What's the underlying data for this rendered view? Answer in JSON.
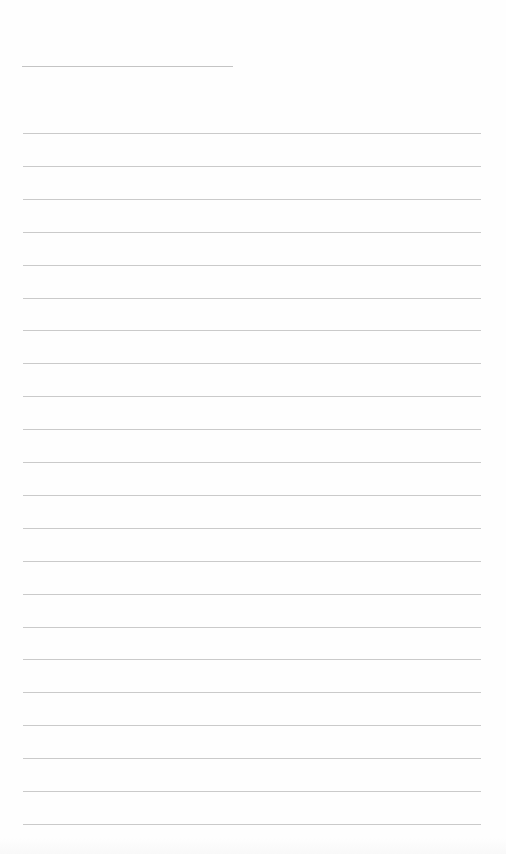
{
  "document": {
    "type": "lined-notebook-page",
    "background_color": "#fefefe",
    "line_color": "#cacaca",
    "header_line": {
      "x": 22,
      "y": 66,
      "width": 211
    },
    "ruled_lines": {
      "x": 23,
      "width": 458,
      "first_y": 133,
      "spacing": 32.9,
      "count": 22
    },
    "text": ""
  }
}
